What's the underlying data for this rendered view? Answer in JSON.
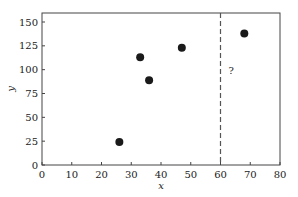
{
  "chart_data": {
    "type": "scatter",
    "title": "",
    "xlabel": "x",
    "ylabel": "y",
    "xlim": [
      0,
      80
    ],
    "ylim": [
      0,
      160
    ],
    "xticks": [
      0,
      10,
      20,
      30,
      40,
      50,
      60,
      70,
      80
    ],
    "yticks": [
      0,
      25,
      50,
      75,
      100,
      125,
      150
    ],
    "grid": false,
    "legend": null,
    "points": [
      {
        "x": 26,
        "y": 24
      },
      {
        "x": 33,
        "y": 113
      },
      {
        "x": 36,
        "y": 89
      },
      {
        "x": 47,
        "y": 123
      },
      {
        "x": 68,
        "y": 138
      }
    ],
    "vline": {
      "x": 60,
      "style": "dashed"
    },
    "annotations": [
      {
        "text": "?",
        "x": 62,
        "y": 100
      }
    ]
  }
}
